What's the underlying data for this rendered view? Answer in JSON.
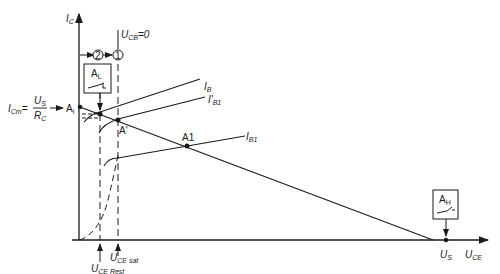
{
  "axes": {
    "y_label": "I",
    "y_sub": "C",
    "x_label": "U",
    "x_sub": "CE"
  },
  "top": {
    "ucb_label": "U",
    "ucb_sub": "CB",
    "ucb_eq": "=0",
    "marker_1": "1",
    "marker_2": "2"
  },
  "left": {
    "icm_label": "I",
    "icm_sub": "Cm",
    "eq": "=",
    "num": "U",
    "num_sub": "S",
    "den": "R",
    "den_sub": "C"
  },
  "points": {
    "ai": "A",
    "ai_sub": "i",
    "a_prime": "A'",
    "a1": "A1",
    "al": "A",
    "al_sub": "L",
    "ah": "A",
    "ah_sub": "H"
  },
  "curves": {
    "ib": "I",
    "ib_sub": "B",
    "ib1_prime": "I'",
    "ib1_prime_sub": "B1",
    "ib1": "I",
    "ib1_sub": "B1"
  },
  "bottom": {
    "us": "U",
    "us_sub": "S",
    "uce_sat": "U",
    "uce_sat_sub": "CE sat",
    "uce_rest": "U",
    "uce_rest_sub": "CE Rest"
  }
}
